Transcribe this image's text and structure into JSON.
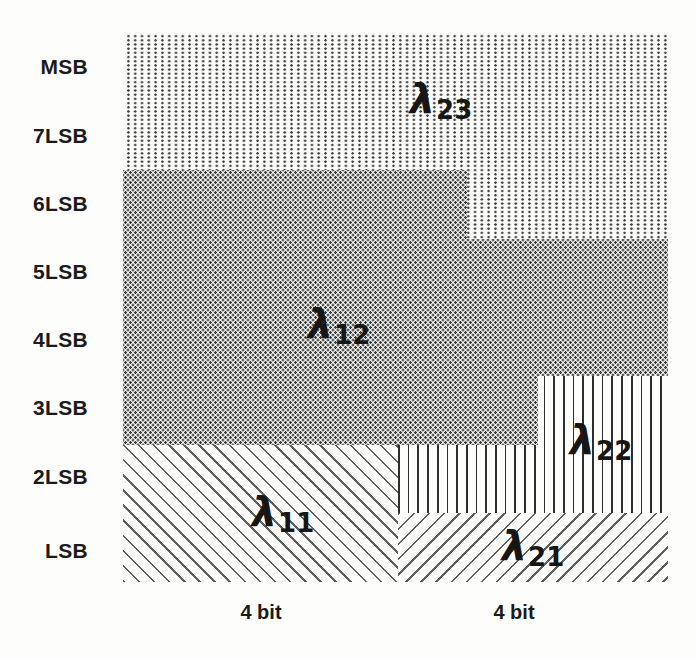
{
  "figure": {
    "type": "bit-allocation-diagram",
    "row_labels": [
      "MSB",
      "7LSB",
      "6LSB",
      "5LSB",
      "4LSB",
      "3LSB",
      "2LSB",
      "LSB"
    ],
    "col_labels": [
      "4 bit",
      "4 bit"
    ],
    "regions": [
      {
        "name": "lambda-23",
        "symbol": "λ",
        "subscript": "23",
        "pattern": "sparse-dots",
        "covers": "MSB and 7LSB rows full width, plus 6LSB row on the right portion"
      },
      {
        "name": "lambda-12",
        "symbol": "λ",
        "subscript": "12",
        "pattern": "dense-dots",
        "covers": "6LSB to 3LSB rows on the left, 5LSB-4LSB rows full width, 3LSB partial right"
      },
      {
        "name": "lambda-22",
        "symbol": "λ",
        "subscript": "22",
        "pattern": "vertical-lines",
        "covers": "3LSB and 2LSB rows far right, 2LSB row middle-right"
      },
      {
        "name": "lambda-11",
        "symbol": "λ",
        "subscript": "11",
        "pattern": "diagonal-backslash-hatch",
        "covers": "2LSB and LSB rows, left 4-bit column"
      },
      {
        "name": "lambda-21",
        "symbol": "λ",
        "subscript": "21",
        "pattern": "diagonal-slash-hatch",
        "covers": "LSB row, right 4-bit column"
      }
    ],
    "colors": {
      "background": "#fdfdfc",
      "dot_ink": "#3a3a3a",
      "line_ink": "#2e2e2e",
      "hatch_ink": "#5f5f5f",
      "text_ink": "#1a1a1a"
    }
  }
}
